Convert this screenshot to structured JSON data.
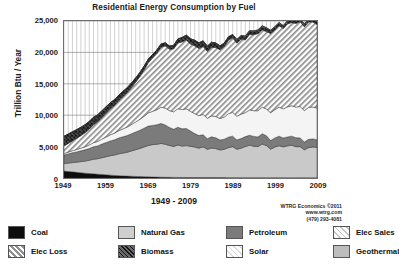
{
  "chart_data": {
    "type": "area",
    "stacked": true,
    "title": "Residential Energy Consumption by Fuel",
    "xlabel": "1949 - 2009",
    "ylabel": "Trillion Btu / Year",
    "xlim": [
      1949,
      2009
    ],
    "ylim": [
      0,
      25000
    ],
    "ytick_labels": [
      "0",
      "5,000",
      "10,000",
      "15,000",
      "20,000",
      "25,000"
    ],
    "ytick_values": [
      0,
      5000,
      10000,
      15000,
      20000,
      25000
    ],
    "xtick_labels": [
      "1949",
      "1959",
      "1969",
      "1979",
      "1989",
      "1999",
      "2009"
    ],
    "xtick_values": [
      1949,
      1959,
      1969,
      1979,
      1989,
      1999,
      2009
    ],
    "grid": "vertical-yearly-and-horizontal",
    "legend_position": "below",
    "x": [
      1949,
      1950,
      1951,
      1952,
      1953,
      1954,
      1955,
      1956,
      1957,
      1958,
      1959,
      1960,
      1961,
      1962,
      1963,
      1964,
      1965,
      1966,
      1967,
      1968,
      1969,
      1970,
      1971,
      1972,
      1973,
      1974,
      1975,
      1976,
      1977,
      1978,
      1979,
      1980,
      1981,
      1982,
      1983,
      1984,
      1985,
      1986,
      1987,
      1988,
      1989,
      1990,
      1991,
      1992,
      1993,
      1994,
      1995,
      1996,
      1997,
      1998,
      1999,
      2000,
      2001,
      2002,
      2003,
      2004,
      2005,
      2006,
      2007,
      2008,
      2009
    ],
    "series": [
      {
        "name": "Coal",
        "pattern": "solid",
        "color": "#0d0d0d",
        "values": [
          1100,
          1030,
          980,
          900,
          830,
          760,
          700,
          660,
          600,
          560,
          500,
          450,
          410,
          370,
          330,
          300,
          280,
          250,
          220,
          200,
          180,
          160,
          140,
          120,
          110,
          100,
          95,
          90,
          85,
          80,
          78,
          75,
          72,
          70,
          68,
          66,
          64,
          62,
          60,
          58,
          56,
          54,
          52,
          50,
          48,
          46,
          44,
          43,
          42,
          41,
          40,
          39,
          38,
          37,
          36,
          35,
          34,
          33,
          32,
          31,
          30
        ]
      },
      {
        "name": "Natural Gas",
        "pattern": "solid",
        "color": "#c9c9c9",
        "values": [
          1200,
          1340,
          1480,
          1620,
          1780,
          1930,
          2120,
          2330,
          2470,
          2680,
          2880,
          3100,
          3250,
          3480,
          3640,
          3800,
          4030,
          4250,
          4480,
          4750,
          5000,
          5150,
          5230,
          5380,
          5270,
          5080,
          4940,
          5160,
          5000,
          5080,
          4980,
          4860,
          4680,
          4890,
          4500,
          4700,
          4620,
          4400,
          4500,
          4770,
          4940,
          4520,
          4700,
          4960,
          5170,
          5010,
          4960,
          5360,
          5130,
          4540,
          4890,
          5100,
          4920,
          5080,
          5180,
          4950,
          4960,
          4460,
          4800,
          4900,
          4850
        ]
      },
      {
        "name": "Petroleum",
        "pattern": "solid",
        "color": "#7b7b7b",
        "values": [
          1350,
          1460,
          1560,
          1640,
          1720,
          1790,
          1880,
          1990,
          2040,
          2160,
          2270,
          2350,
          2420,
          2530,
          2600,
          2660,
          2740,
          2820,
          2900,
          2990,
          3090,
          3060,
          3100,
          3180,
          3060,
          2870,
          2730,
          2840,
          2740,
          2720,
          2420,
          2140,
          2000,
          1930,
          1700,
          1790,
          1710,
          1590,
          1620,
          1680,
          1670,
          1490,
          1520,
          1580,
          1590,
          1570,
          1530,
          1640,
          1560,
          1380,
          1450,
          1510,
          1420,
          1420,
          1450,
          1430,
          1390,
          1240,
          1320,
          1280,
          1230
        ]
      },
      {
        "name": "Elec Sales",
        "pattern": "solid",
        "color": "#f4f4f4",
        "values": [
          250,
          290,
          330,
          380,
          430,
          490,
          560,
          640,
          710,
          790,
          890,
          980,
          1060,
          1160,
          1260,
          1360,
          1470,
          1600,
          1740,
          1900,
          2090,
          2240,
          2400,
          2590,
          2700,
          2680,
          2780,
          2940,
          3060,
          3150,
          3120,
          3180,
          3180,
          3230,
          3230,
          3330,
          3390,
          3420,
          3530,
          3730,
          3800,
          3770,
          3900,
          3820,
          4020,
          4090,
          4180,
          4240,
          4270,
          4430,
          4500,
          4640,
          4620,
          4800,
          4830,
          4890,
          5000,
          5000,
          5100,
          5100,
          5030
        ]
      },
      {
        "name": "Elec Loss",
        "pattern": "diagonal-hatch",
        "color": "#a8a8a8",
        "values": [
          1200,
          1380,
          1560,
          1760,
          1980,
          2230,
          2520,
          2860,
          3130,
          3440,
          3810,
          4150,
          4430,
          4800,
          5150,
          5490,
          5880,
          6330,
          6800,
          7350,
          7990,
          8500,
          8960,
          9560,
          9890,
          9760,
          10000,
          10470,
          10780,
          10960,
          10740,
          10790,
          10690,
          10810,
          10650,
          10930,
          10970,
          10960,
          11190,
          11700,
          11850,
          11640,
          11930,
          11570,
          12010,
          12110,
          12260,
          12320,
          12300,
          12610,
          12690,
          12960,
          12820,
          13230,
          13230,
          13310,
          13500,
          13340,
          13590,
          13510,
          13320
        ]
      },
      {
        "name": "Biomass",
        "pattern": "crosshatch",
        "color": "#4a4a4a",
        "values": [
          1540,
          1490,
          1440,
          1390,
          1330,
          1280,
          1230,
          1180,
          1120,
          1070,
          1010,
          960,
          910,
          860,
          820,
          770,
          730,
          690,
          650,
          610,
          580,
          550,
          530,
          500,
          490,
          520,
          560,
          640,
          700,
          760,
          830,
          880,
          900,
          900,
          830,
          800,
          730,
          600,
          560,
          530,
          520,
          530,
          530,
          560,
          560,
          540,
          540,
          570,
          550,
          470,
          460,
          440,
          380,
          400,
          400,
          400,
          430,
          390,
          440,
          470,
          450
        ]
      },
      {
        "name": "Solar",
        "pattern": "light-diagonal",
        "color": "#ededed",
        "values": [
          0,
          0,
          0,
          0,
          0,
          0,
          0,
          0,
          0,
          0,
          0,
          0,
          0,
          0,
          0,
          0,
          0,
          0,
          0,
          0,
          0,
          0,
          0,
          0,
          0,
          0,
          0,
          0,
          0,
          0,
          0,
          0,
          0,
          0,
          0,
          0,
          0,
          0,
          0,
          0,
          0,
          60,
          60,
          60,
          60,
          62,
          64,
          66,
          68,
          68,
          68,
          66,
          66,
          66,
          64,
          64,
          64,
          66,
          68,
          70,
          72
        ]
      },
      {
        "name": "Geothermal",
        "pattern": "solid",
        "color": "#bdbdbd",
        "values": [
          0,
          0,
          0,
          0,
          0,
          0,
          0,
          0,
          0,
          0,
          0,
          0,
          0,
          0,
          0,
          0,
          0,
          0,
          0,
          0,
          0,
          0,
          0,
          0,
          0,
          0,
          0,
          0,
          0,
          0,
          0,
          0,
          0,
          0,
          0,
          0,
          0,
          0,
          0,
          0,
          0,
          8,
          9,
          10,
          11,
          12,
          13,
          14,
          15,
          16,
          17,
          18,
          19,
          20,
          21,
          22,
          23,
          24,
          25,
          26,
          27
        ]
      }
    ]
  },
  "credit": {
    "line1": "WTRG Economics ©2011",
    "line2": "www.wtrg.com",
    "line3": "(479) 293-4081"
  },
  "legend": {
    "row1": [
      {
        "label": "Coal",
        "swatch": "coal-swatch"
      },
      {
        "label": "Natural Gas",
        "swatch": "natural-gas-swatch"
      },
      {
        "label": "Petroleum",
        "swatch": "petroleum-swatch"
      },
      {
        "label": "Elec Sales",
        "swatch": "elec-sales-swatch"
      }
    ],
    "row2": [
      {
        "label": "Elec Loss",
        "swatch": "elec-loss-swatch"
      },
      {
        "label": "Biomass",
        "swatch": "biomass-swatch"
      },
      {
        "label": "Solar",
        "swatch": "solar-swatch"
      },
      {
        "label": "Geothermal",
        "swatch": "geothermal-swatch"
      }
    ]
  }
}
